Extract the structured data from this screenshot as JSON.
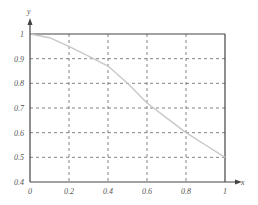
{
  "chart_data": {
    "type": "line",
    "title": "",
    "xlabel": "x",
    "ylabel": "y",
    "xlim": [
      0,
      1
    ],
    "ylim": [
      0.4,
      1
    ],
    "grid": true,
    "legend": null,
    "x_ticks": [
      "0",
      "0.2",
      "0.4",
      "0.6",
      "0.8",
      "1"
    ],
    "y_ticks": [
      "0.4",
      "0.5",
      "0.6",
      "0.7",
      "0.8",
      "0.9",
      "1"
    ],
    "series": [
      {
        "name": "curve",
        "color": "#c8c8c8",
        "x": [
          0,
          0.1,
          0.2,
          0.3,
          0.4,
          0.5,
          0.6,
          0.7,
          0.8,
          0.9,
          1.0
        ],
        "y": [
          1.0,
          0.985,
          0.95,
          0.91,
          0.87,
          0.8,
          0.72,
          0.66,
          0.6,
          0.55,
          0.5
        ]
      }
    ]
  },
  "colors": {
    "axis": "#444444",
    "grid": "#666666",
    "curve": "#c8c8c8"
  }
}
